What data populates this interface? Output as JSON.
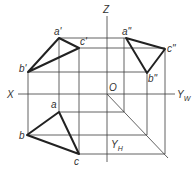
{
  "diagram": {
    "type": "orthographic-projection",
    "axes": {
      "z_label": "Z",
      "x_label": "X",
      "yw_label": "Y",
      "yw_sub": "W",
      "yh_label": "Y",
      "yh_sub": "H",
      "origin_label": "O"
    },
    "front_view": {
      "labels": {
        "a": "a'",
        "b": "b'",
        "c": "c'"
      },
      "points": {
        "a": [
          59,
          38
        ],
        "b": [
          28,
          72
        ],
        "c": [
          79,
          48
        ]
      }
    },
    "side_view": {
      "labels": {
        "a": "a\"",
        "b": "b\"",
        "c": "c\""
      },
      "points": {
        "a": [
          126,
          38
        ],
        "b": [
          147,
          73
        ],
        "c": [
          165,
          49
        ]
      }
    },
    "top_view": {
      "labels": {
        "a": "a",
        "b": "b",
        "c": "c"
      },
      "points": {
        "a": [
          59,
          112
        ],
        "b": [
          27,
          135
        ],
        "c": [
          79,
          154
        ]
      }
    },
    "colors": {
      "line": "#222222",
      "text": "#333333",
      "background": "#ffffff"
    }
  }
}
